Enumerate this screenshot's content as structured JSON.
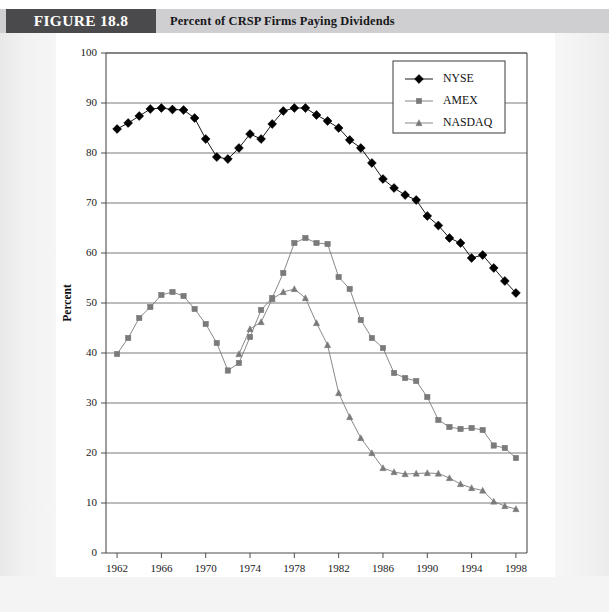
{
  "header": {
    "figure_tag": "FIGURE 18.8",
    "figure_title": "Percent of CRSP Firms Paying Dividends"
  },
  "chart_data": {
    "type": "line",
    "title": "Percent of CRSP Firms Paying Dividends",
    "xlabel": "Year",
    "ylabel": "Percent",
    "xlim": [
      1961,
      1999
    ],
    "ylim": [
      0,
      100
    ],
    "xticks": [
      1962,
      1966,
      1970,
      1974,
      1978,
      1982,
      1986,
      1990,
      1994,
      1998
    ],
    "yticks": [
      0,
      10,
      20,
      30,
      40,
      50,
      60,
      70,
      80,
      90,
      100
    ],
    "grid": "horizontal",
    "legend_position": "top-right",
    "x": [
      1962,
      1963,
      1964,
      1965,
      1966,
      1967,
      1968,
      1969,
      1970,
      1971,
      1972,
      1973,
      1974,
      1975,
      1976,
      1977,
      1978,
      1979,
      1980,
      1981,
      1982,
      1983,
      1984,
      1985,
      1986,
      1987,
      1988,
      1989,
      1990,
      1991,
      1992,
      1993,
      1994,
      1995,
      1996,
      1997,
      1998
    ],
    "series": [
      {
        "name": "NYSE",
        "color": "#000000",
        "marker": "diamond",
        "values": [
          84.8,
          86.0,
          87.4,
          88.8,
          89.0,
          88.7,
          88.6,
          87.0,
          82.8,
          79.2,
          78.8,
          81.0,
          83.8,
          82.8,
          85.8,
          88.4,
          89.0,
          89.0,
          87.6,
          86.4,
          85.0,
          82.6,
          81.0,
          78.0,
          74.8,
          73.0,
          71.6,
          70.6,
          67.4,
          65.5,
          63.0,
          62.0,
          59.0,
          59.6,
          57.0,
          54.4,
          52.0
        ]
      },
      {
        "name": "AMEX",
        "color": "#7a7a7a",
        "marker": "square",
        "values": [
          39.8,
          43.0,
          47.0,
          49.2,
          51.6,
          52.2,
          51.4,
          48.8,
          45.8,
          42.0,
          36.5,
          38.0,
          43.2,
          48.6,
          51.0,
          56.0,
          62.0,
          63.0,
          62.0,
          61.8,
          55.2,
          52.8,
          46.6,
          43.0,
          41.0,
          36.0,
          35.0,
          34.4,
          31.2,
          26.6,
          25.2,
          24.8,
          25.0,
          24.6,
          21.5,
          21.0,
          19.0
        ]
      },
      {
        "name": "NASDAQ",
        "color": "#7a7a7a",
        "marker": "triangle",
        "values": [
          null,
          null,
          null,
          null,
          null,
          null,
          null,
          null,
          null,
          null,
          null,
          39.8,
          44.8,
          46.2,
          50.8,
          52.2,
          52.8,
          51.0,
          46.0,
          41.6,
          32.0,
          27.2,
          23.0,
          20.0,
          17.0,
          16.2,
          15.8,
          15.9,
          16.0,
          15.9,
          15.0,
          13.8,
          13.0,
          12.5,
          10.3,
          9.4,
          8.8
        ]
      }
    ]
  }
}
